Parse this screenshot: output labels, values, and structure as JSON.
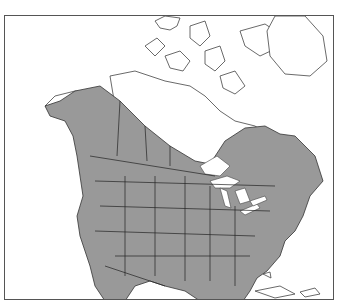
{
  "map": {
    "title": "North America range map",
    "region": "North America",
    "legend": [],
    "colors": {
      "range_fill": "#999999",
      "land_fill": "#ffffff",
      "outline": "#444444",
      "frame": "#555555"
    },
    "features": {
      "range": "Shaded distribution covering most of the contiguous United States, southern/western Canada, southern Alaska, and northern Mexico",
      "unshaded": [
        "Arctic Archipelago",
        "Greenland",
        "Northern Canada",
        "Hudson Bay area",
        "Caribbean islands"
      ]
    }
  }
}
